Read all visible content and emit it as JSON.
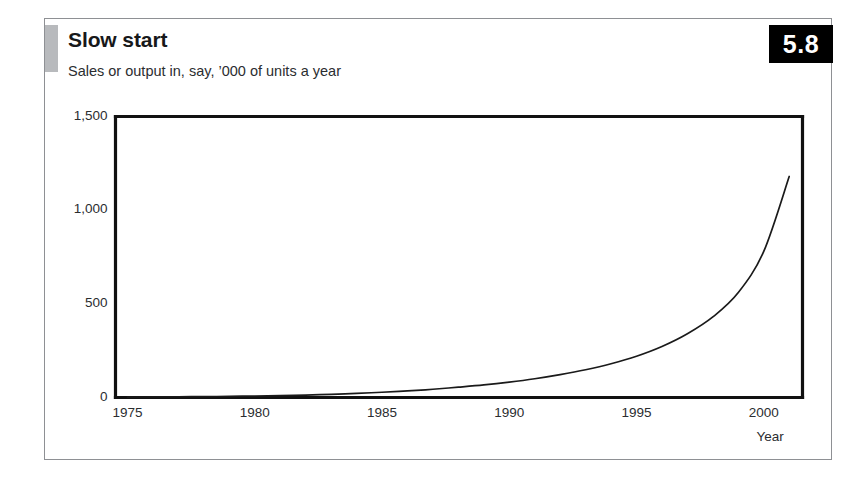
{
  "figure": {
    "number_label": "5.8",
    "title": "Slow start",
    "subtitle": "Sales or output in, say, ’000 of units a year"
  },
  "chart_data": {
    "type": "line",
    "title": "Slow start",
    "subtitle": "Sales or output in, say, '000 of units a year",
    "xlabel": "Year",
    "ylabel": "",
    "xlim": [
      1975,
      2001
    ],
    "ylim": [
      0,
      1500
    ],
    "grid": false,
    "legend": null,
    "xticks": [
      "1975",
      "1980",
      "1985",
      "1990",
      "1995",
      "2000"
    ],
    "xtick_values": [
      1975,
      1980,
      1985,
      1990,
      1995,
      2000
    ],
    "yticks": [
      "0",
      "500",
      "1,000",
      "1,500"
    ],
    "ytick_values": [
      0,
      500,
      1000,
      1500
    ],
    "series": [
      {
        "name": "Sales or output",
        "color": "#1a1a1a",
        "x": [
          1975,
          1976,
          1977,
          1978,
          1979,
          1980,
          1981,
          1982,
          1983,
          1984,
          1985,
          1986,
          1987,
          1988,
          1989,
          1990,
          1991,
          1992,
          1993,
          1994,
          1995,
          1996,
          1997,
          1998,
          1999,
          2000,
          2001
        ],
        "values": [
          2,
          3,
          4,
          5,
          6,
          8,
          10,
          13,
          17,
          22,
          28,
          35,
          44,
          55,
          67,
          82,
          100,
          122,
          148,
          180,
          220,
          272,
          340,
          430,
          560,
          780,
          1180
        ]
      }
    ]
  },
  "axis_labels": {
    "x_axis_title": "Year"
  },
  "colors": {
    "line": "#1a1a1a",
    "frame": "#111111",
    "card_border": "#8e9094",
    "accent": "#b8babd",
    "badge_bg": "#000000",
    "badge_text": "#ffffff"
  }
}
